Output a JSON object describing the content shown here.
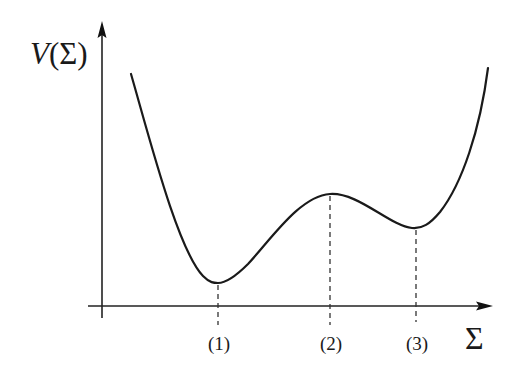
{
  "diagram": {
    "title": "",
    "y_axis": {
      "label_var": "V",
      "label_arg": "(Σ)"
    },
    "x_axis": {
      "label": "Σ"
    },
    "points": [
      {
        "id": "1",
        "label": "(1)",
        "kind": "global minimum",
        "x": 218,
        "y": 283
      },
      {
        "id": "2",
        "label": "(2)",
        "kind": "local maximum",
        "x": 330,
        "y": 194
      },
      {
        "id": "3",
        "label": "(3)",
        "kind": "local minimum",
        "x": 416,
        "y": 228
      }
    ],
    "colors": {
      "line": "#1a1a1a",
      "background": "#ffffff"
    }
  }
}
